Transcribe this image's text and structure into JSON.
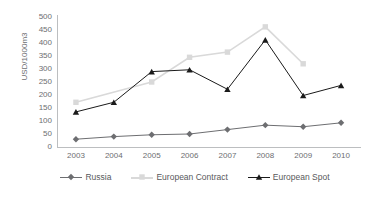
{
  "chart_data": {
    "type": "line",
    "title": "",
    "xlabel": "",
    "ylabel": "USD/1000m3",
    "categories": [
      "2003",
      "2004",
      "2005",
      "2006",
      "2007",
      "2008",
      "2009",
      "2010"
    ],
    "ylim": [
      0,
      500
    ],
    "ytick_step": 50,
    "yticks": [
      "500",
      "450",
      "400",
      "350",
      "300",
      "250",
      "200",
      "150",
      "100",
      "50",
      "0"
    ],
    "grid": false,
    "legend_position": "bottom",
    "series": [
      {
        "name": "Russia",
        "color": "#6d6e71",
        "marker": "diamond",
        "values": [
          30,
          40,
          47,
          50,
          67,
          84,
          78,
          93
        ]
      },
      {
        "name": "European Contract",
        "color": "#d9d9d9",
        "marker": "square",
        "values": [
          172,
          null,
          250,
          345,
          365,
          462,
          320,
          null
        ]
      },
      {
        "name": "European Spot",
        "color": "#1a1a1a",
        "marker": "triangle",
        "values": [
          135,
          172,
          290,
          297,
          222,
          412,
          198,
          237
        ]
      }
    ]
  },
  "axis": {
    "y_title": "USD/1000m3"
  },
  "legend": {
    "items": [
      {
        "label": "Russia",
        "color": "#6d6e71",
        "marker": "diamond"
      },
      {
        "label": "European Contract",
        "color": "#d9d9d9",
        "marker": "square"
      },
      {
        "label": "European Spot",
        "color": "#1a1a1a",
        "marker": "triangle"
      }
    ]
  }
}
